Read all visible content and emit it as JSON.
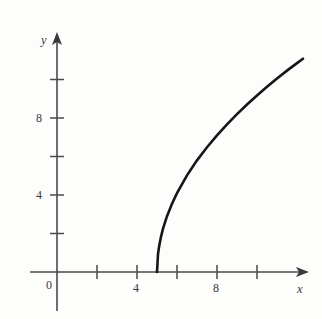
{
  "figure": {
    "background_color": "#fdfdfc",
    "axis_color": "#4a4a4a",
    "curve_color": "#161616",
    "x_axis_name": "x",
    "y_axis_name": "y",
    "origin_label": "0"
  },
  "chart_data": {
    "type": "line",
    "title": "",
    "subtitle": "",
    "xlabel": "x",
    "ylabel": "y",
    "legend": [],
    "annotations": [],
    "grid": false,
    "legend_position": "none",
    "xlim": [
      -1,
      12.8
    ],
    "ylim": [
      -1.1,
      12.4
    ],
    "x_ticks": [
      2,
      4,
      6,
      8,
      10
    ],
    "x_tick_labels": [
      "",
      "4",
      "",
      "8",
      ""
    ],
    "y_ticks": [
      2,
      4,
      6,
      8,
      10
    ],
    "y_tick_labels": [
      "",
      "4",
      "",
      "8",
      ""
    ],
    "origin_tick_label": "0",
    "series": [
      {
        "name": "y = 4.1*sqrt(x-5)",
        "x": [
          5.0,
          5.05,
          5.1,
          5.2,
          5.3,
          5.5,
          5.75,
          6.0,
          6.5,
          7.0,
          7.5,
          8.0,
          8.5,
          9.0,
          9.5,
          10.0,
          10.5,
          11.0,
          11.5,
          12.0,
          12.3
        ],
        "values": [
          0.0,
          0.92,
          1.3,
          1.83,
          2.25,
          2.9,
          3.55,
          4.1,
          5.02,
          5.8,
          6.48,
          7.1,
          7.67,
          8.2,
          8.7,
          9.17,
          9.62,
          10.05,
          10.46,
          10.85,
          11.08
        ]
      }
    ]
  }
}
